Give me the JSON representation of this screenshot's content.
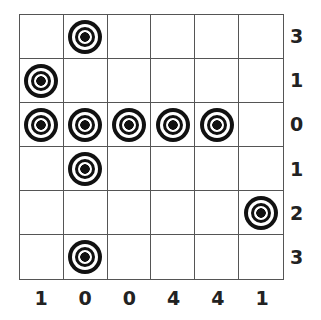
{
  "puzzle": {
    "rows": 6,
    "cols": 6,
    "targets": [
      [
        0,
        1,
        0,
        0,
        0,
        0
      ],
      [
        1,
        0,
        0,
        0,
        0,
        0
      ],
      [
        1,
        1,
        1,
        1,
        1,
        0
      ],
      [
        0,
        1,
        0,
        0,
        0,
        0
      ],
      [
        0,
        0,
        0,
        0,
        0,
        1
      ],
      [
        0,
        1,
        0,
        0,
        0,
        0
      ]
    ],
    "row_clues": [
      "3",
      "1",
      "0",
      "1",
      "2",
      "3"
    ],
    "col_clues": [
      "1",
      "0",
      "0",
      "4",
      "4",
      "1"
    ],
    "target_icon": "bullseye-target-icon"
  }
}
